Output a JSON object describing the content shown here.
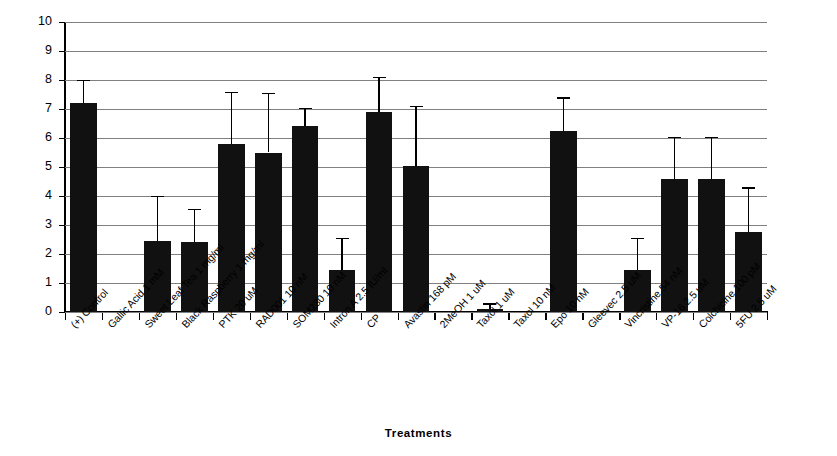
{
  "chart_data": {
    "type": "bar",
    "title": "",
    "xlabel": "Treatments",
    "ylabel": "Mean Angiogenic Index (± 2SEM)",
    "ylim": [
      0,
      10
    ],
    "ytick_step": 1,
    "grid": true,
    "legend": "none",
    "bar_color": "#111111",
    "gridline_color": "#808080",
    "axis_color": "#000000",
    "yticks": [
      "0",
      "1",
      "2",
      "3",
      "4",
      "5",
      "6",
      "7",
      "8",
      "9",
      "10"
    ],
    "categories": [
      "(+) Control",
      "Gallic Acid 1 mM",
      "Sweet Leaf Tea 1 mg/ml",
      "Black Raspberry 1 mg/ml",
      "PTK 20 uM",
      "RAD001 10 nM",
      "SOM230 10 nM",
      "Intron  A 2.5 IU/ml",
      "CP",
      "Avastin 168 pM",
      "2MeOH 1 uM",
      "Taxol 1 uM",
      "Taxol 10 nM",
      "Epo 10 nM",
      "Gleevec 2.5 uM",
      "Vincristine 54 nM",
      "VP-16 2.5 uM",
      "Colchicine 100 pM",
      "5FU 2.5 uM"
    ],
    "values": [
      7.2,
      0,
      2.45,
      2.4,
      5.8,
      5.5,
      6.4,
      1.45,
      6.9,
      5.05,
      0,
      0.1,
      0,
      6.25,
      0,
      1.45,
      4.6,
      4.6,
      2.75
    ],
    "error_upper": [
      8.0,
      0,
      4.0,
      3.55,
      7.6,
      7.55,
      7.05,
      2.55,
      8.1,
      7.1,
      0,
      0.3,
      0,
      7.4,
      0,
      2.55,
      6.05,
      6.05,
      4.3
    ]
  }
}
